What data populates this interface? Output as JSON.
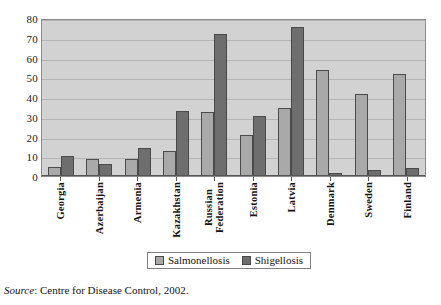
{
  "chart_data": {
    "type": "bar",
    "title": "",
    "subtitle": "",
    "xlabel": "",
    "ylabel": "",
    "ylim": [
      0,
      80
    ],
    "ytick_step": 10,
    "yticks": [
      "80",
      "70",
      "60",
      "50",
      "40",
      "30",
      "20",
      "10",
      "0"
    ],
    "grid": true,
    "legend_position": "bottom-center",
    "categories": [
      "Georgia",
      "Azerbaijan",
      "Armenia",
      "Kazakhstan",
      "Russian Federation",
      "Estonia",
      "Latvia",
      "Denmark",
      "Sweden",
      "Finland"
    ],
    "series": [
      {
        "name": "Salmonellosis",
        "color": "#a9a9a9",
        "values": [
          4.5,
          8.8,
          8.8,
          12.8,
          32.5,
          21.0,
          34.5,
          53.5,
          41.5,
          51.8
        ]
      },
      {
        "name": "Shigellosis",
        "color": "#6e6e6e",
        "values": [
          10.0,
          6.0,
          14.0,
          33.0,
          72.0,
          30.5,
          75.5,
          1.5,
          2.8,
          4.2
        ]
      }
    ],
    "plot_background": "#d2d2d2",
    "gridline_color": "#b4b4b4",
    "bar_border_color": "#4a4a4a"
  },
  "legend": {
    "items": [
      {
        "label": "Salmonellosis",
        "swatch": "s1"
      },
      {
        "label": "Shigellosis",
        "swatch": "s2"
      }
    ]
  },
  "source_note": {
    "label": "Source",
    "text": ": Centre for Disease Control, 2002."
  }
}
